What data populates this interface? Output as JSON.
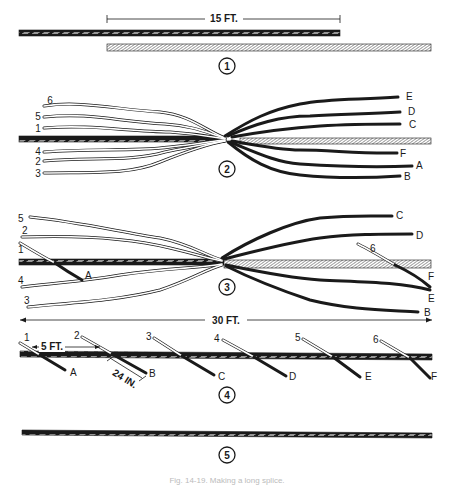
{
  "figure": {
    "caption": "Fig. 14-19. Making a long splice.",
    "colors": {
      "dark_rope": "#1a1a1a",
      "light_rope": "#ffffff",
      "stroke": "#1a1a1a"
    }
  },
  "steps": [
    {
      "number": "1",
      "dimension": "15 FT."
    },
    {
      "number": "2",
      "left_strands": [
        "6",
        "5",
        "1",
        "4",
        "2",
        "3"
      ],
      "right_strands": [
        "E",
        "D",
        "C",
        "F",
        "A",
        "B"
      ]
    },
    {
      "number": "3",
      "left_strands": [
        "5",
        "2",
        "1",
        "4",
        "3"
      ],
      "right_strands": [
        "C",
        "D",
        "6",
        "F",
        "E",
        "B"
      ],
      "mid_label": "A",
      "dimension": "30 FT."
    },
    {
      "number": "4",
      "pairs": [
        {
          "top": "1",
          "bottom": "A"
        },
        {
          "top": "2",
          "bottom": "B"
        },
        {
          "top": "3",
          "bottom": "C"
        },
        {
          "top": "4",
          "bottom": "D"
        },
        {
          "top": "5",
          "bottom": "E"
        },
        {
          "top": "6",
          "bottom": "F"
        }
      ],
      "dim_a": "5 FT.",
      "dim_b": "24 IN."
    },
    {
      "number": "5"
    }
  ]
}
